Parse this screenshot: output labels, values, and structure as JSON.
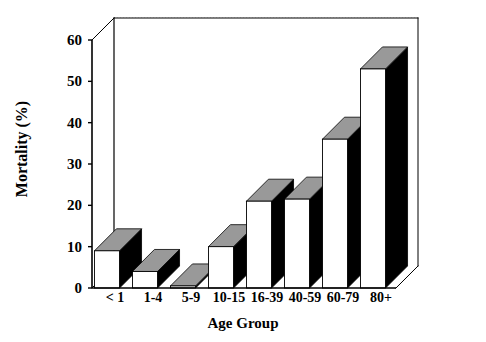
{
  "chart_data": {
    "type": "bar",
    "title": "",
    "xlabel": "Age Group",
    "ylabel": "Mortality (%)",
    "categories": [
      "< 1",
      "1-4",
      "5-9",
      "10-15",
      "16-39",
      "40-59",
      "60-79",
      "80+"
    ],
    "values": [
      9,
      4,
      0.5,
      10,
      21,
      21.5,
      36,
      53
    ],
    "yticks": [
      0,
      10,
      20,
      30,
      40,
      50,
      60
    ],
    "ylim": [
      0,
      60
    ],
    "grid": "horizontal-dotted-on-back-wall",
    "legend": "none",
    "style": "3d-bars",
    "colors": {
      "bar_front": "#ffffff",
      "bar_top": "#999999",
      "bar_side": "#000000",
      "outline": "#000000",
      "gridline": "#bbbbbb",
      "text": "#000000",
      "background": "#ffffff"
    }
  },
  "axes": {
    "y_title": "Mortality (%)",
    "x_title": "Age Group",
    "y_tick_labels": [
      "0",
      "10",
      "20",
      "30",
      "40",
      "50",
      "60"
    ],
    "x_tick_labels": [
      "< 1",
      "1-4",
      "5-9",
      "10-15",
      "16-39",
      "40-59",
      "60-79",
      "80+"
    ]
  }
}
